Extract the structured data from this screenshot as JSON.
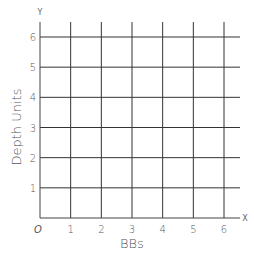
{
  "chart_data": {
    "type": "scatter",
    "title": "",
    "xlabel": "BBs",
    "ylabel": "Depth Units",
    "x_axis_letter": "X",
    "y_axis_letter": "Y",
    "origin_label": "O",
    "xlim": [
      0,
      6
    ],
    "ylim": [
      0,
      6
    ],
    "x_ticks": [
      "1",
      "2",
      "3",
      "4",
      "5",
      "6"
    ],
    "y_ticks": [
      "1",
      "2",
      "3",
      "4",
      "5",
      "6"
    ],
    "grid": true,
    "points": []
  }
}
